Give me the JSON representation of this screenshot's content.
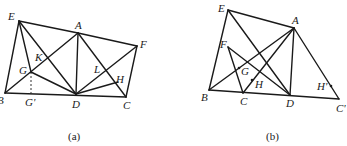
{
  "figures": [
    {
      "id": "a",
      "caption": "(a)",
      "points": {
        "E": {
          "label": "E",
          "x": 19,
          "y": 21
        },
        "A": {
          "label": "A",
          "x": 78,
          "y": 33
        },
        "F": {
          "label": "F",
          "x": 137,
          "y": 46
        },
        "B": {
          "label": "B",
          "x": 5,
          "y": 93
        },
        "D": {
          "label": "D",
          "x": 76,
          "y": 94
        },
        "C": {
          "label": "C",
          "x": 126,
          "y": 97
        },
        "G": {
          "label": "G",
          "x": 31,
          "y": 72
        },
        "G'": {
          "label": "G'",
          "x": 31,
          "y": 93
        },
        "K": {
          "label": "K",
          "x": 47,
          "y": 59
        },
        "L": {
          "label": "L",
          "x": 107,
          "y": 71
        },
        "H": {
          "label": "H",
          "x": 118,
          "y": 82
        }
      },
      "segments": [
        [
          "E",
          "A"
        ],
        [
          "A",
          "F"
        ],
        [
          "E",
          "B"
        ],
        [
          "B",
          "D"
        ],
        [
          "D",
          "C"
        ],
        [
          "C",
          "F"
        ],
        [
          "E",
          "G"
        ],
        [
          "E",
          "D"
        ],
        [
          "B",
          "A"
        ],
        [
          "A",
          "D"
        ],
        [
          "A",
          "C"
        ],
        [
          "G",
          "D"
        ],
        [
          "D",
          "F"
        ],
        [
          "D",
          "H"
        ]
      ],
      "dashed": [
        [
          "G",
          "G'"
        ]
      ]
    },
    {
      "id": "b",
      "caption": "(b)",
      "points": {
        "E": {
          "label": "E",
          "x": 228,
          "y": 10
        },
        "A": {
          "label": "A",
          "x": 294,
          "y": 28
        },
        "F": {
          "label": "F",
          "x": 228,
          "y": 47
        },
        "G": {
          "label": "G",
          "x": 238,
          "y": 68
        },
        "H": {
          "label": "H",
          "x": 252,
          "y": 81
        },
        "B": {
          "label": "B",
          "x": 209,
          "y": 90
        },
        "C": {
          "label": "C",
          "x": 243,
          "y": 93
        },
        "D": {
          "label": "D",
          "x": 290,
          "y": 95
        },
        "H'": {
          "label": "H'",
          "x": 331,
          "y": 86
        },
        "C'": {
          "label": "C'",
          "x": 339,
          "y": 99
        }
      },
      "segments": [
        [
          "E",
          "A"
        ],
        [
          "E",
          "B"
        ],
        [
          "E",
          "D"
        ],
        [
          "B",
          "C"
        ],
        [
          "C",
          "D"
        ],
        [
          "D",
          "C'"
        ],
        [
          "A",
          "C'"
        ],
        [
          "A",
          "B"
        ],
        [
          "A",
          "D"
        ],
        [
          "A",
          "C"
        ],
        [
          "F",
          "C"
        ],
        [
          "F",
          "D"
        ]
      ],
      "dots": [
        "G",
        "H",
        "H'"
      ]
    }
  ]
}
